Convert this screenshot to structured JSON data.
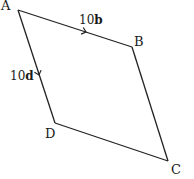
{
  "diagram": {
    "type": "parallelogram",
    "vertices": {
      "A": {
        "label": "A",
        "x": 18,
        "y": 10
      },
      "B": {
        "label": "B",
        "x": 132,
        "y": 47
      },
      "C": {
        "label": "C",
        "x": 168,
        "y": 161
      },
      "D": {
        "label": "D",
        "x": 55,
        "y": 123
      }
    },
    "vectors": {
      "AB": {
        "coefficient": "10",
        "symbol": "b",
        "from": "A",
        "to": "B"
      },
      "AD": {
        "coefficient": "10",
        "symbol": "d",
        "from": "A",
        "to": "D"
      }
    },
    "colors": {
      "stroke": "#222222",
      "text": "#1a1a1a",
      "background": "#ffffff"
    }
  }
}
